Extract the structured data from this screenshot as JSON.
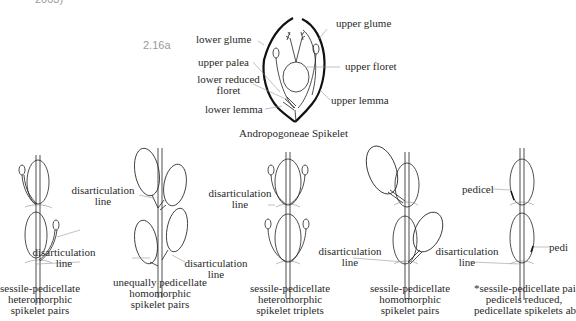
{
  "header_fragment": "2003)",
  "figure_label": "2.16a",
  "spikelet_diagram": {
    "title": "Andropogoneae Spikelet",
    "labels": {
      "lower_glume": "lower glume",
      "upper_palea": "upper palea",
      "lower_reduced_floret_1": "lower reduced",
      "lower_reduced_floret_2": "floret",
      "lower_lemma": "lower lemma",
      "upper_glume": "upper glume",
      "upper_floret": "upper floret",
      "upper_lemma": "upper lemma"
    }
  },
  "disarticulation": {
    "line1": "disarticulation",
    "line2": "line"
  },
  "pedicel_label": "pedicel",
  "pedicel_label_cut": "pedi",
  "panels": [
    {
      "caption": [
        "sessile-pedicellate",
        "heteromorphic",
        "spikelet pairs"
      ]
    },
    {
      "caption": [
        "unequally pedicellate",
        "homomorphic",
        "spikelet pairs"
      ]
    },
    {
      "caption": [
        "sessile-pedicellate",
        "heteromorphic",
        "spikelet triplets"
      ]
    },
    {
      "caption": [
        "sessile-pedicellate",
        "homomorphic",
        "spikelet pairs"
      ]
    },
    {
      "caption": [
        "*sessile-pedicellate pai",
        "pedicels reduced,",
        "pedicellate spikelets ab"
      ]
    }
  ]
}
